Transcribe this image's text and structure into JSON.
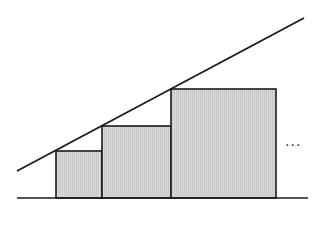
{
  "diagram": {
    "colors": {
      "stroke": "#1a1a1a",
      "fill": "#d9d9d9",
      "hatch": "#c4c4c4",
      "background": "#ffffff"
    },
    "baseline": {
      "x1": 17,
      "y1": 198,
      "x2": 308,
      "y2": 198
    },
    "slope_line": {
      "x1": 17,
      "y1": 171,
      "x2": 304,
      "y2": 18
    },
    "squares": [
      {
        "label": "square-1",
        "x": 56,
        "y": 151,
        "w": 46,
        "h": 47
      },
      {
        "label": "square-2",
        "x": 102,
        "y": 126,
        "w": 69,
        "h": 72
      },
      {
        "label": "square-3",
        "x": 171,
        "y": 89,
        "w": 105,
        "h": 109
      }
    ],
    "continuation": {
      "text": "···",
      "x": 285,
      "y": 138
    }
  }
}
